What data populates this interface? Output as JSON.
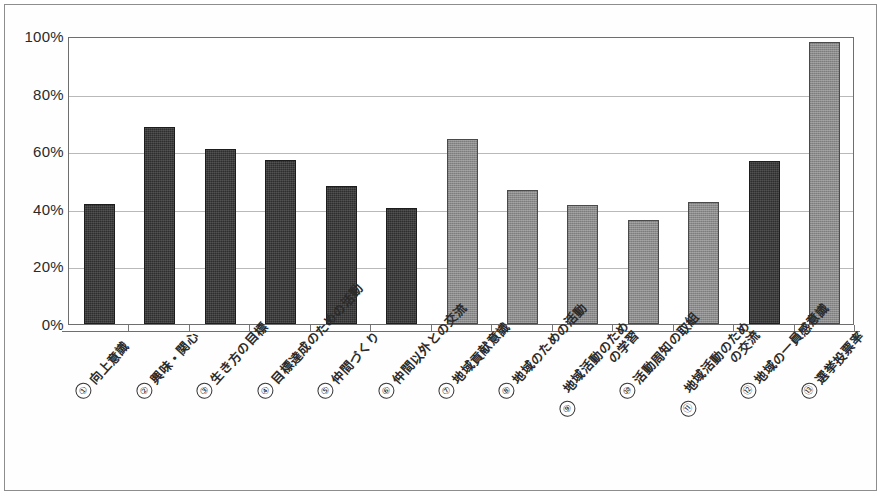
{
  "chart_data": {
    "type": "bar",
    "title": "",
    "xlabel": "",
    "ylabel": "",
    "ylim": [
      0,
      100
    ],
    "ytick_labels": [
      "100%",
      "80%",
      "60%",
      "40%",
      "20%",
      "0%"
    ],
    "ytick_values": [
      100,
      80,
      60,
      40,
      20,
      0
    ],
    "grid": true,
    "legend": "none",
    "units": "percent",
    "categories": [
      "向上意識",
      "興味・関心",
      "生き方の目標",
      "目標達成のための活動",
      "仲間づくり",
      "仲間以外との交流",
      "地域貢献意識",
      "地域のための活動",
      "地域活動のための学習",
      "活動周知の取組",
      "地域活動のための交流",
      "地域の一員感意識",
      "選挙投票率"
    ],
    "values": [
      41.8,
      68.5,
      60.8,
      57.0,
      48.0,
      40.3,
      64.3,
      46.5,
      41.3,
      36.2,
      42.5,
      56.5,
      98.0
    ],
    "series": [
      {
        "name": "項目別割合",
        "values": [
          41.8,
          68.5,
          60.8,
          57.0,
          48.0,
          40.3,
          64.3,
          46.5,
          41.3,
          36.2,
          42.5,
          56.5,
          98.0
        ]
      }
    ],
    "bar_styles": [
      "dark",
      "dark",
      "dark",
      "dark",
      "dark",
      "dark",
      "gray",
      "gray",
      "gray",
      "gray",
      "gray",
      "dark",
      "gray"
    ],
    "colors": {
      "dark": "#2e2e2e",
      "gray": "#8b8b8b",
      "gridline": "#b9b9b9",
      "axis": "#6e6e6e"
    }
  },
  "axis": {
    "y_labels": [
      {
        "text": "100%",
        "value": 100
      },
      {
        "text": "80%",
        "value": 80
      },
      {
        "text": "60%",
        "value": 60
      },
      {
        "text": "40%",
        "value": 40
      },
      {
        "text": "20%",
        "value": 20
      },
      {
        "text": "0%",
        "value": 0
      }
    ]
  },
  "categories_display": [
    {
      "num": "①",
      "line1": "向上意識",
      "line2": ""
    },
    {
      "num": "②",
      "line1": "興味・関心",
      "line2": ""
    },
    {
      "num": "③",
      "line1": "生き方の目標",
      "line2": ""
    },
    {
      "num": "④",
      "line1": "目標達成のための活動",
      "line2": ""
    },
    {
      "num": "⑤",
      "line1": "仲間づくり",
      "line2": ""
    },
    {
      "num": "⑥",
      "line1": "仲間以外との交流",
      "line2": ""
    },
    {
      "num": "⑦",
      "line1": "地域貢献意識",
      "line2": ""
    },
    {
      "num": "⑧",
      "line1": "地域のための活動",
      "line2": ""
    },
    {
      "num": "⑨",
      "line1": "地域活動のため",
      "line2": "の学習"
    },
    {
      "num": "⑩",
      "line1": "活動周知の取組",
      "line2": ""
    },
    {
      "num": "⑪",
      "line1": "地域活動のため",
      "line2": "の交流"
    },
    {
      "num": "⑫",
      "line1": "地域の一員感意識",
      "line2": ""
    },
    {
      "num": "⑬",
      "line1": "選挙投票率",
      "line2": ""
    }
  ]
}
